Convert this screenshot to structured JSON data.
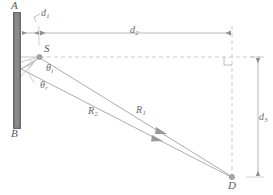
{
  "figure": {
    "type": "optics-ray-diagram",
    "canvas": {
      "width": 273,
      "height": 195,
      "background": "#ffffff"
    }
  },
  "colors": {
    "mirror_fill": "#8a8a8a",
    "mirror_edge_dark": "#5d5d5d",
    "line": "#9a9a9a",
    "dashed": "#b5b5b5",
    "label": "#6e6e6e",
    "marker": "#9a9a9a"
  },
  "labels": {
    "mirror_top": "A",
    "mirror_bottom": "B",
    "source": "S",
    "detector": "D",
    "d1": "d",
    "d1_sub": "1",
    "d2": "d",
    "d2_sub": "2",
    "d3": "d",
    "d3_sub": "3",
    "R1": "R",
    "R1_sub": "1",
    "R2": "R",
    "R2_sub": "2",
    "theta_i": "θ",
    "theta_i_sub": "i",
    "theta_r": "θ",
    "theta_r_sub": "r"
  },
  "geometry": {
    "mirror": {
      "x": 13,
      "y": 12,
      "width": 8,
      "height": 117
    },
    "point_S": {
      "x": 39,
      "y": 57
    },
    "point_D": {
      "x": 232,
      "y": 177
    },
    "reflection_point": {
      "x": 21,
      "y": 69
    },
    "corner_dash_x": 232,
    "dim_line_y": 23,
    "dim_d3_x": 258,
    "right_angle_marker": {
      "x": 213,
      "y": 57
    }
  },
  "annotations": {
    "right_angle": "90-degree angle between d2 and d3",
    "arrowheads": "two ray-direction arrowheads on R1 and R2 pointing toward D"
  }
}
